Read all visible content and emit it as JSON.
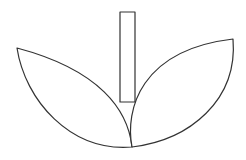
{
  "diagram": {
    "stroke_color": "#333333",
    "fill_color": "#ffffff",
    "background": "#ffffff",
    "stroke_width": 1.2,
    "shapes": {
      "stem": {
        "x": 120,
        "y": 12,
        "width": 15,
        "height": 90
      },
      "left_leaf": {
        "d": "M 132 147 C 128 110, 100 70, 17 48 C 25 100, 70 152, 132 147 Z"
      },
      "right_leaf": {
        "d": "M 132 147 C 125 110, 140 50, 233 39 C 238 100, 190 140, 132 147 Z"
      }
    }
  }
}
